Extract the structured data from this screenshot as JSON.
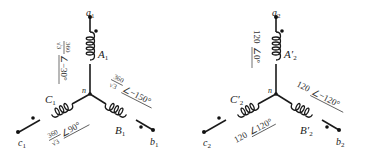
{
  "circuits": [
    {
      "id": "left",
      "neutral": "n",
      "terminals": {
        "a": "a",
        "a_sub": "1",
        "b": "b",
        "b_sub": "1",
        "c": "c",
        "c_sub": "1"
      },
      "coils": {
        "A": "A",
        "A_sub": "1",
        "B": "B",
        "B_sub": "1",
        "C": "C",
        "C_sub": "1"
      },
      "voltages": {
        "A": {
          "num": "360",
          "den": "√3",
          "angle": "−30°"
        },
        "B": {
          "num": "360",
          "den": "√3",
          "angle": "−150°"
        },
        "C": {
          "num": "360",
          "den": "√3",
          "angle": "90°"
        }
      }
    },
    {
      "id": "right",
      "neutral": "n",
      "terminals": {
        "a": "a",
        "a_sub": "2",
        "b": "b",
        "b_sub": "2",
        "c": "c",
        "c_sub": "2"
      },
      "coils": {
        "A": "A′",
        "A_sub": "2",
        "B": "B′",
        "B_sub": "2",
        "C": "C′",
        "C_sub": "2"
      },
      "voltages": {
        "A": {
          "mag": "120",
          "angle": "0°"
        },
        "B": {
          "mag": "120",
          "angle": "−120°"
        },
        "C": {
          "mag": "120",
          "angle": "120°"
        }
      }
    }
  ],
  "angle_symbol": "∠"
}
